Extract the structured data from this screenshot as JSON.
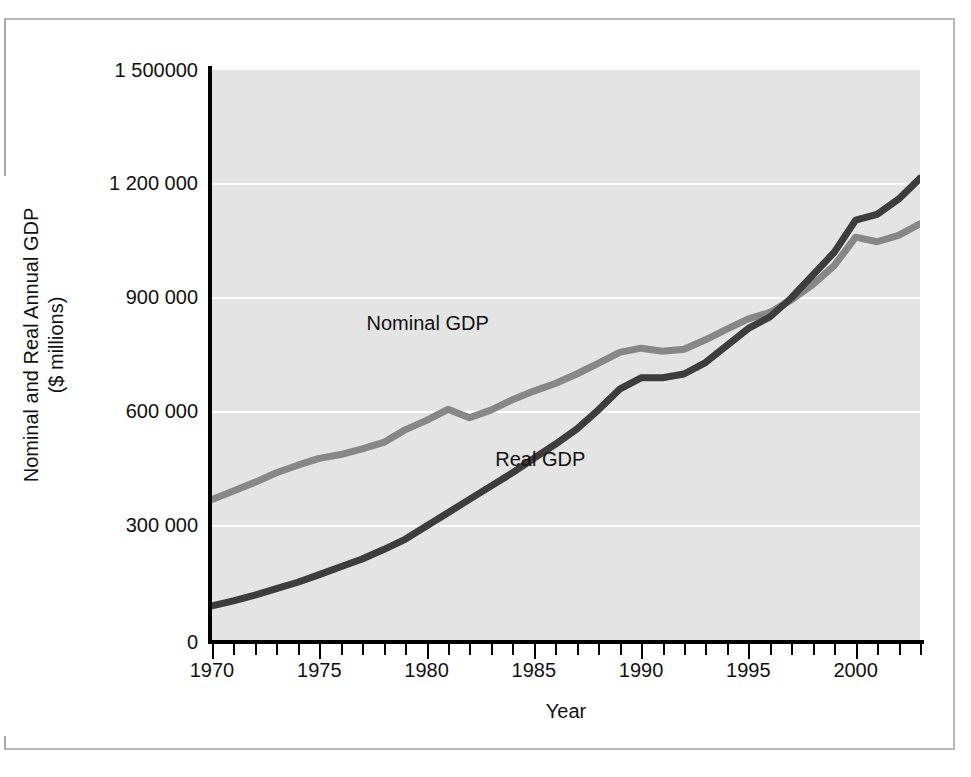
{
  "figure": {
    "y_axis_title": "Nominal and Real Annual GDP",
    "y_axis_title_sub": "($ millions)",
    "x_axis_title": "Year"
  },
  "axes": {
    "y_tick_labels": [
      "1 500000",
      "1 200 000",
      "900 000",
      "600 000",
      "300 000",
      "0"
    ],
    "x_tick_labels": [
      "1970",
      "1975",
      "1980",
      "1985",
      "1990",
      "1995",
      "2000"
    ]
  },
  "series_labels": {
    "nominal": "Nominal GDP",
    "real": "Real GDP"
  },
  "colors": {
    "plot_background": "#e4e4e4",
    "gridline": "#ffffff",
    "axis": "#000000",
    "nominal_line": "#878787",
    "real_line": "#3d3d3d",
    "frame": "#b8b8b8",
    "text": "#111111"
  },
  "chart_data": {
    "type": "line",
    "title": "",
    "xlabel": "Year",
    "ylabel": "Nominal and Real Annual GDP ($ millions)",
    "xlim": [
      1970,
      2003
    ],
    "ylim": [
      0,
      1500000
    ],
    "ytick_values": [
      0,
      300000,
      600000,
      900000,
      1200000,
      1500000
    ],
    "xtick_values": [
      1970,
      1975,
      1980,
      1985,
      1990,
      1995,
      2000
    ],
    "xtick_minor_step": 1,
    "grid": "horizontal",
    "legend": "inline-annotations",
    "x": [
      1970,
      1971,
      1972,
      1973,
      1974,
      1975,
      1976,
      1977,
      1978,
      1979,
      1980,
      1981,
      1982,
      1983,
      1984,
      1985,
      1986,
      1987,
      1988,
      1989,
      1990,
      1991,
      1992,
      1993,
      1994,
      1995,
      1996,
      1997,
      1998,
      1999,
      2000,
      2001,
      2002,
      2003
    ],
    "series": [
      {
        "name": "Nominal GDP",
        "color": "#878787",
        "values": [
          370000,
          392000,
          415000,
          440000,
          460000,
          478000,
          488000,
          503000,
          520000,
          553000,
          578000,
          607000,
          585000,
          605000,
          632000,
          655000,
          675000,
          700000,
          728000,
          757000,
          768000,
          760000,
          765000,
          790000,
          818000,
          845000,
          862000,
          895000,
          935000,
          985000,
          1060000,
          1048000,
          1065000,
          1095000
        ],
        "annotation": {
          "text": "Nominal GDP",
          "x": 1980,
          "y": 830000
        }
      },
      {
        "name": "Real GDP",
        "color": "#3d3d3d",
        "values": [
          90000,
          103000,
          118000,
          135000,
          152000,
          172000,
          193000,
          213000,
          238000,
          265000,
          300000,
          335000,
          370000,
          405000,
          440000,
          478000,
          515000,
          555000,
          605000,
          660000,
          690000,
          690000,
          700000,
          730000,
          775000,
          820000,
          850000,
          900000,
          960000,
          1020000,
          1105000,
          1120000,
          1160000,
          1215000
        ],
        "annotation": {
          "text": "Real GDP",
          "x": 1986,
          "y": 470000
        }
      }
    ]
  }
}
